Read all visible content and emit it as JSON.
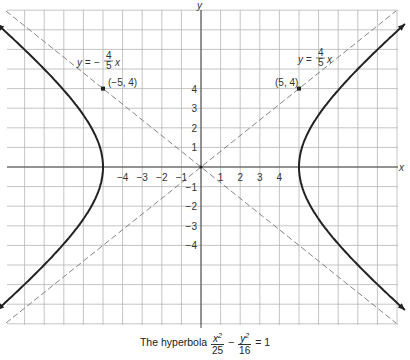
{
  "chart_data": {
    "type": "line",
    "equation": {
      "a2": 25,
      "b2": 16
    },
    "xlabel": "x",
    "ylabel": "y",
    "xlim": [
      -10,
      10
    ],
    "ylim": [
      -8,
      8
    ],
    "grid": true,
    "x_ticks": [
      -4,
      -3,
      -2,
      -1,
      1,
      2,
      3,
      4
    ],
    "y_ticks": [
      4,
      3,
      2,
      1,
      -1,
      -2,
      -3,
      -4
    ],
    "series": [
      {
        "name": "hyperbola right branch",
        "style": "solid-thick",
        "vertex": [
          5,
          0
        ]
      },
      {
        "name": "hyperbola left branch",
        "style": "solid-thick",
        "vertex": [
          -5,
          0
        ]
      },
      {
        "name": "asymptote y = 4/5 x",
        "style": "dashed",
        "slope": 0.8
      },
      {
        "name": "asymptote y = -4/5 x",
        "style": "dashed",
        "slope": -0.8
      }
    ],
    "points": [
      {
        "label": "(5, 4)",
        "x": 5,
        "y": 4
      },
      {
        "label": "(-5, 4)",
        "x": -5,
        "y": 4
      }
    ],
    "annotations": [
      {
        "text": "y = 4/5 x",
        "near": "upper-right asymptote"
      },
      {
        "text": "y = -4/5 x",
        "near": "upper-left asymptote"
      }
    ]
  },
  "labels": {
    "x_axis": "x",
    "y_axis": "y",
    "pos_asymptote": {
      "lhs": "y =",
      "num": "4",
      "den": "5",
      "var": "x"
    },
    "neg_asymptote": {
      "lhs": "y = −",
      "num": "4",
      "den": "5",
      "var": "x"
    },
    "point_right": "(5, 4)",
    "point_left": "(−5, 4)",
    "x_ticks": [
      "−4",
      "−3",
      "−2",
      "−1",
      "1",
      "2",
      "3",
      "4"
    ],
    "y_ticks": [
      "4",
      "3",
      "2",
      "1",
      "−1",
      "−2",
      "−3",
      "−4"
    ]
  },
  "caption": {
    "prefix": "The hyperbola",
    "f1_num": "x",
    "f1_exp": "2",
    "f1_den": "25",
    "minus": "−",
    "f2_num": "y",
    "f2_exp": "2",
    "f2_den": "16",
    "suffix": "= 1"
  }
}
